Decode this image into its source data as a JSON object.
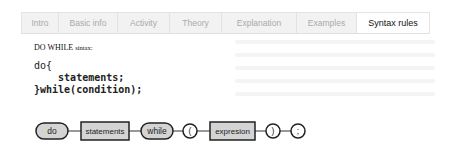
{
  "tabs": [
    {
      "label": "Intro",
      "active": false
    },
    {
      "label": "Basic info",
      "active": false
    },
    {
      "label": "Activity",
      "active": false
    },
    {
      "label": "Theory",
      "active": false
    },
    {
      "label": "Explanation",
      "active": false
    },
    {
      "label": "Examples",
      "active": false
    },
    {
      "label": "Syntax rules",
      "active": true
    }
  ],
  "content": {
    "heading_main": "DO WHILE ",
    "heading_small": "sintax:",
    "code_lines": [
      "do{",
      "    statements;",
      "}while(condition);"
    ]
  },
  "diagram": {
    "nodes": [
      {
        "label": "do",
        "kind": "terminal"
      },
      {
        "label": "statements",
        "kind": "nonterminal"
      },
      {
        "label": "while",
        "kind": "terminal"
      },
      {
        "label": "(",
        "kind": "symbol"
      },
      {
        "label": "expresion",
        "kind": "nonterminal"
      },
      {
        "label": ")",
        "kind": "symbol"
      },
      {
        "label": ";",
        "kind": "symbol"
      }
    ]
  },
  "colors": {
    "node_fill": "#d4d4d4",
    "node_stroke": "#222222",
    "tab_bg": "#f2f2f2",
    "tab_active_bg": "#ffffff"
  }
}
